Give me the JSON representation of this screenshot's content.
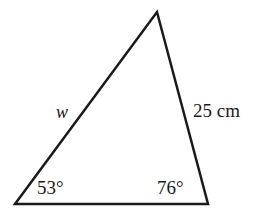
{
  "figure": {
    "type": "triangle-diagram",
    "background_color": "#ffffff",
    "stroke_color": "#1a1a1a",
    "stroke_width": 2.5,
    "vertices": {
      "bottom_left": [
        15,
        204
      ],
      "bottom_right": [
        208,
        204
      ],
      "apex": [
        157,
        12
      ]
    },
    "labels": {
      "angle_left": "53°",
      "angle_right": "76°",
      "side_right": "25 cm",
      "side_left": "w"
    }
  },
  "chart_data": {
    "type": "diagram",
    "title": "",
    "shape": "triangle",
    "angles": [
      {
        "vertex": "bottom-left",
        "label": "53°",
        "value": 53,
        "unit": "degrees"
      },
      {
        "vertex": "bottom-right",
        "label": "76°",
        "value": 76,
        "unit": "degrees"
      }
    ],
    "sides": [
      {
        "name": "right-side",
        "label": "25 cm",
        "value": 25,
        "unit": "cm",
        "known": true
      },
      {
        "name": "left-side",
        "label": "w",
        "value": null,
        "unit": "cm",
        "known": false
      }
    ]
  }
}
